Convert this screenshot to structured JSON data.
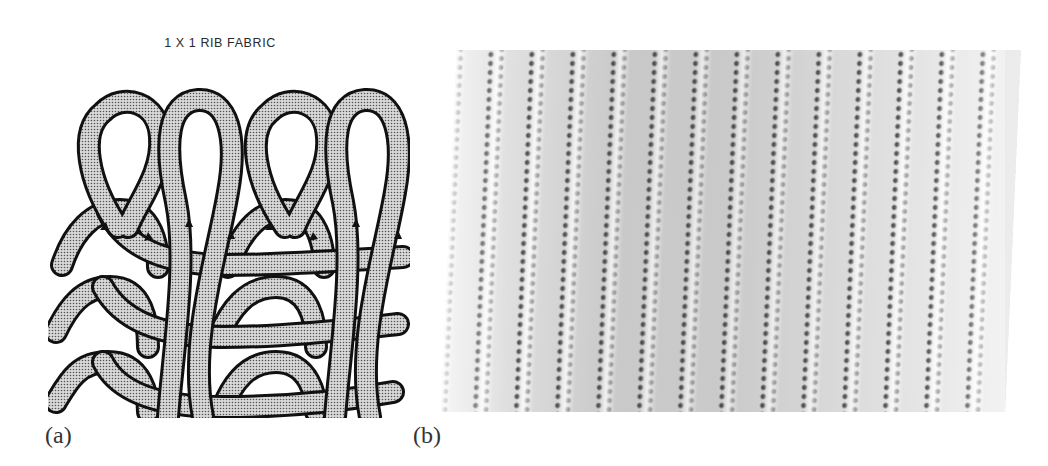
{
  "figure": {
    "panels": [
      {
        "label": "(a)",
        "title": "1 X 1 RIB FABRIC",
        "type": "schematic-diagram",
        "description": "Loop diagram of 1x1 rib knit: alternating face and back wales, 4 loops per course, 3 courses, with arrows indicating yarn path"
      },
      {
        "label": "(b)",
        "type": "photograph",
        "description": "Grayscale photograph of 1x1 rib knitted fabric showing vertical ribs"
      }
    ]
  },
  "colors": {
    "yarn_fill": "#bdbdbd",
    "yarn_outline": "#111111",
    "background": "#ffffff"
  }
}
